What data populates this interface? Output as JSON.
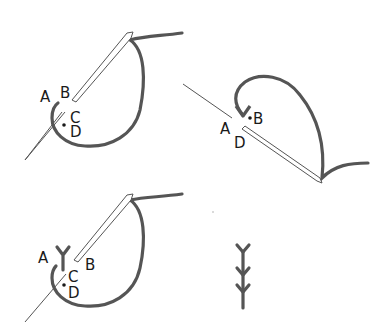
{
  "diagram": {
    "colors": {
      "thread": "#555555",
      "needle_outline": "#555555",
      "background": "#ffffff",
      "label": "#1a1a1a"
    },
    "panels": [
      {
        "id": "step-1",
        "labels": {
          "a": "A",
          "b": "B",
          "c": "C",
          "d": "D"
        }
      },
      {
        "id": "step-2",
        "labels": {
          "a": "A",
          "b": "B",
          "d": "D"
        }
      },
      {
        "id": "step-3",
        "labels": {
          "a": "A",
          "b": "B",
          "c": "C",
          "d": "D"
        }
      },
      {
        "id": "result",
        "stitch_count": 3
      }
    ]
  }
}
